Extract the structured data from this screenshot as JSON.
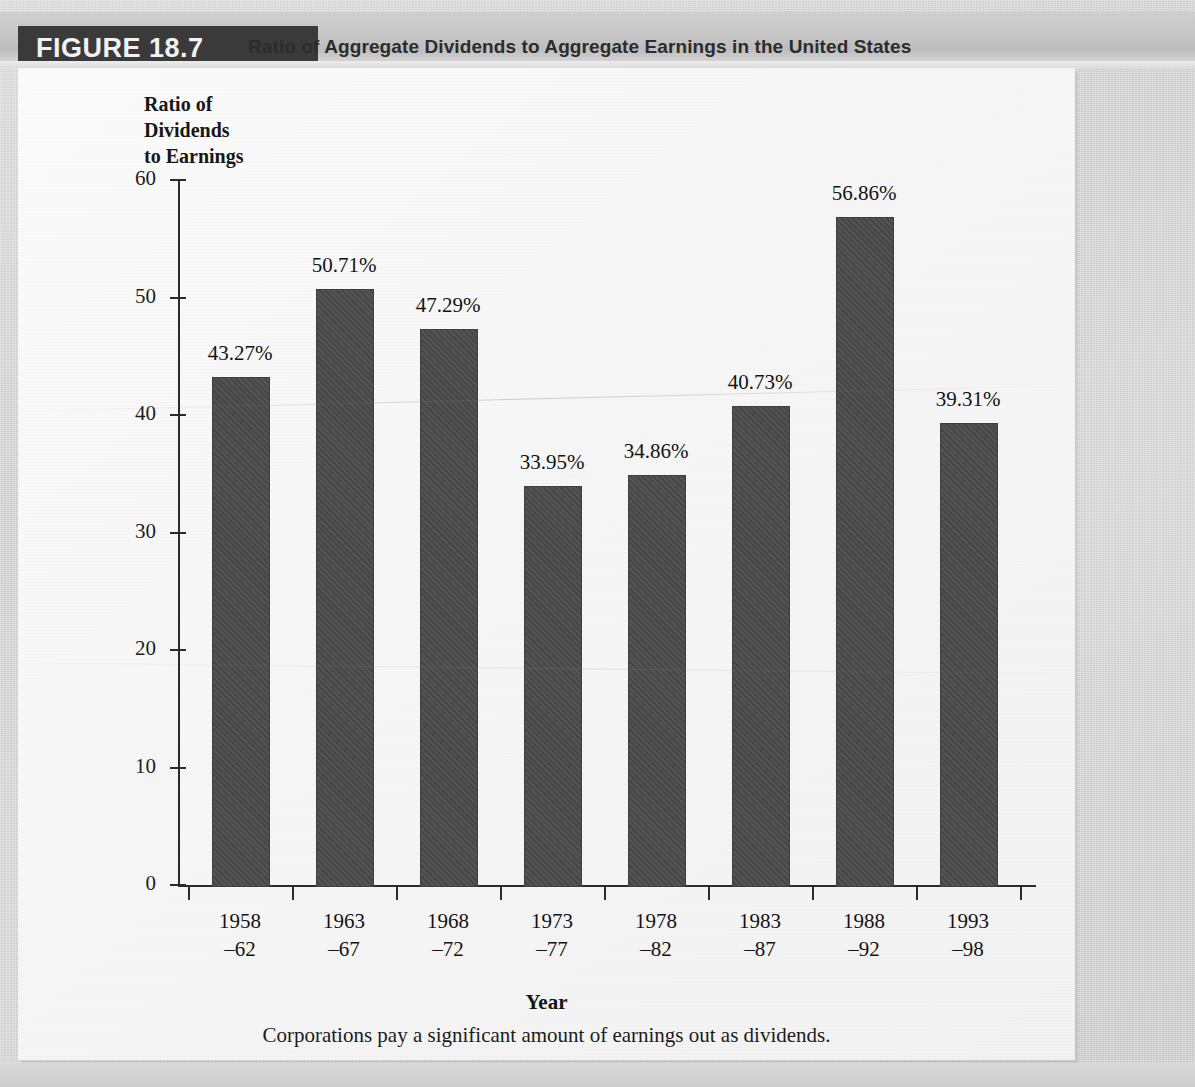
{
  "figure": {
    "tag": "FIGURE 18.7",
    "title": "Ratio of Aggregate Dividends to Aggregate Earnings in the United States",
    "caption": "Corporations pay a significant amount of earnings out as dividends."
  },
  "chart_data": {
    "type": "bar",
    "title": "Ratio of Aggregate Dividends to Aggregate Earnings in the United States",
    "ylabel": "Ratio of Dividends to Earnings",
    "ylabel_lines": [
      "Ratio of",
      "Dividends",
      "to Earnings"
    ],
    "xlabel": "Year",
    "categories": [
      "1958–62",
      "1963–67",
      "1968–72",
      "1973–77",
      "1978–82",
      "1983–87",
      "1988–92",
      "1993–98"
    ],
    "category_lines": [
      {
        "top": "1958",
        "bottom": "–62"
      },
      {
        "top": "1963",
        "bottom": "–67"
      },
      {
        "top": "1968",
        "bottom": "–72"
      },
      {
        "top": "1973",
        "bottom": "–77"
      },
      {
        "top": "1978",
        "bottom": "–82"
      },
      {
        "top": "1983",
        "bottom": "–87"
      },
      {
        "top": "1988",
        "bottom": "–92"
      },
      {
        "top": "1993",
        "bottom": "–98"
      }
    ],
    "values": [
      43.27,
      50.71,
      47.29,
      33.95,
      34.86,
      40.73,
      56.86,
      39.31
    ],
    "value_labels": [
      "43.27%",
      "50.71%",
      "47.29%",
      "33.95%",
      "34.86%",
      "40.73%",
      "56.86%",
      "39.31%"
    ],
    "ylim": [
      0,
      60
    ],
    "yticks": [
      0,
      10,
      20,
      30,
      40,
      50,
      60
    ],
    "ytick_labels": [
      "0",
      "10",
      "20",
      "30",
      "40",
      "50",
      "60"
    ],
    "grid": false,
    "legend": "none",
    "bar_color": "#4b4b4b"
  },
  "colors": {
    "bar": "#4b4b4b",
    "axis": "#2b2b2b",
    "tag_background": "#3a3a3a",
    "tag_text": "#f2f2f2",
    "paper": "#d2d2d2",
    "panel": "#f7f7f7"
  }
}
